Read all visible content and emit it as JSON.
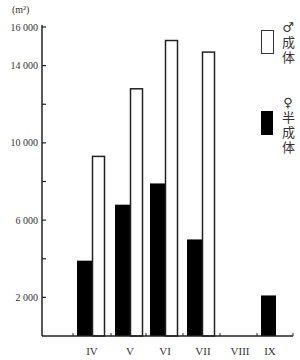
{
  "chart_data": {
    "type": "bar",
    "title": "",
    "unit_label": "(m²)",
    "xlabel": "",
    "ylabel": "(m²)",
    "ylim": [
      0,
      16000
    ],
    "yticks": [
      0,
      2000,
      4000,
      6000,
      8000,
      10000,
      12000,
      14000,
      16000
    ],
    "ytick_labels": [
      "2 000",
      "6 000",
      "10 000",
      "14 000",
      "16 000"
    ],
    "categories": [
      "IV",
      "V",
      "VI",
      "VII",
      "VIII",
      "IX"
    ],
    "series": [
      {
        "name": "♀ 半成体",
        "color": "#000000",
        "values": [
          3900,
          6800,
          7900,
          5000,
          0,
          2100
        ]
      },
      {
        "name": "♂ 成体",
        "color": "#ffffff",
        "values": [
          9300,
          12800,
          15300,
          14700,
          0,
          0
        ]
      }
    ],
    "legend_position": "right",
    "grid": false
  },
  "legend": {
    "male_symbol": "♂",
    "male_chars": [
      "成",
      "体"
    ],
    "female_symbol": "♀",
    "female_chars": [
      "半",
      "成",
      "体"
    ]
  }
}
